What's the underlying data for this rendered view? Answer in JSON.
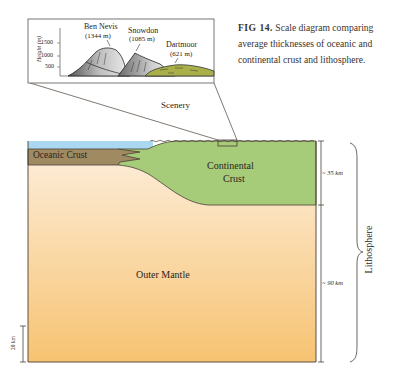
{
  "header": {
    "text": "11 · Geology"
  },
  "caption": {
    "fig_label": "FIG 14.",
    "text": "Scale diagram comparing average thicknesses of oceanic and continental crust and lithosphere."
  },
  "inset": {
    "y_axis_label": "Height (m)",
    "y_ticks": [
      "1500",
      "1000",
      "500"
    ],
    "peaks": [
      {
        "name": "Ben Nevis",
        "height": "(1344 m)"
      },
      {
        "name": "Snowdon",
        "height": "(1085 m)"
      },
      {
        "name": "Dartmoor",
        "height": "(621 m)"
      }
    ]
  },
  "main": {
    "scenery_label": "Scenery",
    "oceanic_crust_label": "Oceanic Crust",
    "continental_crust_label_1": "Continental",
    "continental_crust_label_2": "Crust",
    "outer_mantle_label": "Outer Mantle",
    "thickness_35": "~ 35 km",
    "thickness_90": "~ 90 km",
    "scale_bar": "20 km",
    "lithosphere_label": "Lithosphere"
  },
  "colors": {
    "water": "#a9d8f0",
    "oceanic_crust": "#a08a62",
    "continental_crust": "#a6cc7a",
    "mantle_top": "#fdebd2",
    "mantle_bottom": "#f8c57a",
    "outline": "#4a3f35"
  }
}
